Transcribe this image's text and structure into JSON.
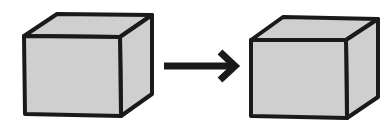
{
  "diagram": {
    "colors": {
      "background": "#ffffff",
      "cube_fill": "#cfcfcf",
      "cube_stroke": "#1a1a1a",
      "arrow": "#1a1a1a"
    },
    "nodes": [
      {
        "id": "cube-left",
        "shape": "cube",
        "label": ""
      },
      {
        "id": "cube-right",
        "shape": "cube",
        "label": ""
      }
    ],
    "edges": [
      {
        "from": "cube-left",
        "to": "cube-right",
        "style": "arrow"
      }
    ]
  }
}
